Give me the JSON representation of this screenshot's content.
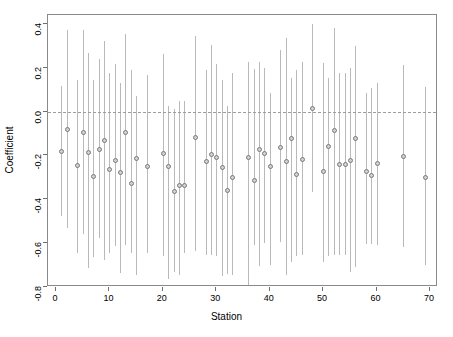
{
  "chart_data": {
    "type": "scatter",
    "title": "",
    "xlabel": "Station",
    "ylabel": "Coefficient",
    "xlim": [
      -1.5,
      71.5
    ],
    "ylim": [
      -0.8,
      0.44
    ],
    "grid": false,
    "legend": null,
    "xticks": [
      0,
      10,
      20,
      30,
      40,
      50,
      60,
      70
    ],
    "xtick_labels": [
      "0",
      "10",
      "20",
      "30",
      "40",
      "50",
      "60",
      "70"
    ],
    "yticks": [
      0.4,
      0.2,
      0.0,
      -0.2,
      -0.4,
      -0.6,
      -0.8
    ],
    "ytick_labels": [
      "0.4",
      "0.2",
      "0.0",
      "-0.2",
      "-0.4",
      "-0.6",
      "-0.8"
    ],
    "reference_line": {
      "y": 0.0,
      "style": "dashed",
      "color": "#9d9d9d"
    },
    "marker": {
      "shape": "circle",
      "color": "#7a7a7a",
      "fill": "#d2d2d2",
      "size": 5
    },
    "errorbar": {
      "style": "vertical-line",
      "color": "#b9b9b9",
      "width": 1
    },
    "series_name": "Station coefficient with 95% confidence interval",
    "x": [
      1,
      2,
      4,
      5,
      6,
      7,
      8,
      9,
      10,
      11,
      12,
      13,
      14,
      15,
      17,
      20,
      21,
      22,
      23,
      24,
      26,
      28,
      29,
      30,
      31,
      32,
      33,
      36,
      37,
      38,
      39,
      40,
      42,
      43,
      44,
      45,
      46,
      48,
      50,
      51,
      52,
      53,
      54,
      55,
      56,
      58,
      59,
      60,
      65,
      69
    ],
    "values": [
      -0.18,
      -0.08,
      -0.245,
      -0.095,
      -0.185,
      -0.295,
      -0.175,
      -0.13,
      -0.265,
      -0.225,
      -0.28,
      -0.095,
      -0.33,
      -0.215,
      -0.25,
      -0.19,
      -0.25,
      -0.365,
      -0.335,
      -0.335,
      -0.12,
      -0.23,
      -0.195,
      -0.21,
      -0.255,
      -0.36,
      -0.3,
      -0.21,
      -0.315,
      -0.175,
      -0.19,
      -0.25,
      -0.165,
      -0.23,
      -0.125,
      -0.285,
      -0.22,
      0.015,
      -0.275,
      -0.16,
      -0.085,
      -0.24,
      -0.24,
      -0.225,
      -0.125,
      -0.275,
      -0.29,
      -0.235,
      -0.205,
      -0.3
    ],
    "ci_lower": [
      -0.475,
      -0.53,
      -0.645,
      -0.56,
      -0.715,
      -0.665,
      -0.575,
      -0.675,
      -0.645,
      -0.615,
      -0.735,
      -0.61,
      -0.645,
      -0.745,
      -0.645,
      -0.66,
      -0.765,
      -0.73,
      -0.745,
      -0.645,
      -0.635,
      -0.655,
      -0.655,
      -0.66,
      -0.75,
      -0.74,
      -0.745,
      -0.795,
      -0.61,
      -0.705,
      -0.6,
      -0.7,
      -0.595,
      -0.745,
      -0.685,
      -0.66,
      -0.655,
      -0.365,
      -0.685,
      -0.66,
      -0.655,
      -0.655,
      -0.655,
      -0.73,
      -0.71,
      -0.605,
      -0.605,
      -0.61,
      -0.62,
      -0.7
    ],
    "ci_upper": [
      0.115,
      0.37,
      0.145,
      0.37,
      0.265,
      0.145,
      0.24,
      0.32,
      0.175,
      0.215,
      0.13,
      0.355,
      0.19,
      0.07,
      0.165,
      0.26,
      0.025,
      0.01,
      0.05,
      0.05,
      0.345,
      0.19,
      0.305,
      0.215,
      0.145,
      0.025,
      0.175,
      0.225,
      0.195,
      0.225,
      0.2,
      0.085,
      0.28,
      0.335,
      0.155,
      0.19,
      0.225,
      0.4,
      0.22,
      0.155,
      0.38,
      0.175,
      0.175,
      0.2,
      0.3,
      0.085,
      0.105,
      0.13,
      0.21,
      0.11
    ]
  },
  "axes": {
    "x_title": "Station",
    "y_title": "Coefficient"
  }
}
